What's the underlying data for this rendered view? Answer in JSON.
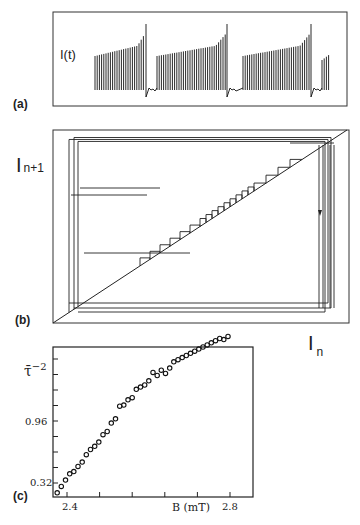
{
  "figure": {
    "panels": [
      {
        "id": "a",
        "label": "(a)",
        "ylabel": "I(t)",
        "description": "Time series of current I(t) showing bursts of oscillations with growing amplitude separated by quiescent intervals"
      },
      {
        "id": "b",
        "label": "(b)",
        "ylabel_main": "I",
        "ylabel_sub": "n+1",
        "xlabel_main": "I",
        "xlabel_sub": "n",
        "description": "Return map I_{n+1} vs I_n with diagonal and staircase trajectory; arrow marks reinjection"
      },
      {
        "id": "c",
        "label": "(c)",
        "ylabel": "τ̄",
        "ylabel_exp": "−2",
        "xlabel": "B (mT)"
      }
    ]
  },
  "chart_data": [
    {
      "type": "line",
      "panel": "a",
      "title": "",
      "ylabel": "I(t)",
      "xlabel": "",
      "bursts": 4,
      "grid": false
    },
    {
      "type": "line",
      "panel": "b",
      "title": "",
      "xlabel": "I_n",
      "ylabel": "I_{n+1}",
      "series": [
        {
          "name": "diagonal",
          "values": "I_{n+1} = I_n"
        },
        {
          "name": "return-map trajectory",
          "values": "staircase along diagonal"
        }
      ],
      "grid": false
    },
    {
      "type": "scatter",
      "panel": "c",
      "title": "",
      "xlabel": "B (mT)",
      "ylabel": "τ̄^-2",
      "x_ticks": [
        "2.4",
        "2.8"
      ],
      "y_ticks": [
        "0.32",
        "0.96"
      ],
      "xlim": [
        2.38,
        2.86
      ],
      "ylim": [
        0.18,
        1.6
      ],
      "grid": false,
      "x": [
        2.39,
        2.4,
        2.41,
        2.42,
        2.43,
        2.44,
        2.45,
        2.46,
        2.47,
        2.48,
        2.49,
        2.5,
        2.51,
        2.52,
        2.53,
        2.54,
        2.55,
        2.56,
        2.57,
        2.58,
        2.59,
        2.6,
        2.61,
        2.62,
        2.63,
        2.64,
        2.65,
        2.66,
        2.67,
        2.68,
        2.69,
        2.7,
        2.71,
        2.72,
        2.73,
        2.74,
        2.75,
        2.76,
        2.77,
        2.78,
        2.79,
        2.8
      ],
      "y": [
        0.22,
        0.28,
        0.34,
        0.4,
        0.42,
        0.47,
        0.51,
        0.58,
        0.63,
        0.66,
        0.7,
        0.77,
        0.8,
        0.88,
        0.92,
        1.04,
        1.05,
        1.1,
        1.12,
        1.2,
        1.22,
        1.24,
        1.28,
        1.36,
        1.33,
        1.38,
        1.35,
        1.4,
        1.46,
        1.48,
        1.5,
        1.52,
        1.54,
        1.56,
        1.58,
        1.6,
        1.62,
        1.64,
        1.66,
        1.68,
        1.67,
        1.7
      ]
    }
  ]
}
